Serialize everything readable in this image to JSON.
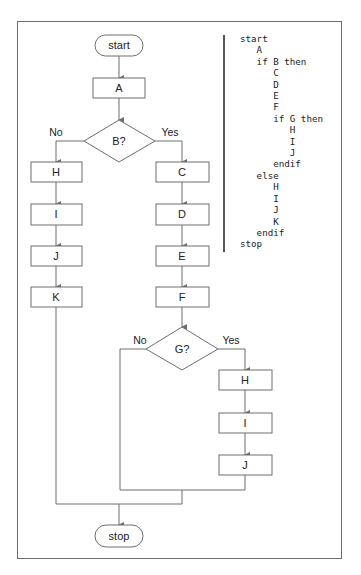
{
  "flowchart": {
    "terminals": {
      "start": "start",
      "stop": "stop"
    },
    "nodes": {
      "a": "A",
      "b_decision": "B?",
      "left_h": "H",
      "left_i": "I",
      "left_j": "J",
      "left_k": "K",
      "c": "C",
      "d": "D",
      "e": "E",
      "f": "F",
      "g_decision": "G?",
      "inner_h": "H",
      "inner_i": "I",
      "inner_j": "J"
    },
    "branch_labels": {
      "b_no": "No",
      "b_yes": "Yes",
      "g_no": "No",
      "g_yes": "Yes"
    }
  },
  "pseudocode": {
    "lines": [
      "start",
      "   A",
      "   if B then",
      "      C",
      "      D",
      "      E",
      "      F",
      "      if G then",
      "         H",
      "         I",
      "         J",
      "      endif",
      "   else",
      "      H",
      "      I",
      "      J",
      "      K",
      "   endif",
      "stop"
    ]
  },
  "colors": {
    "stroke": "#6e6e6e",
    "text": "#222222",
    "background": "#ffffff"
  }
}
